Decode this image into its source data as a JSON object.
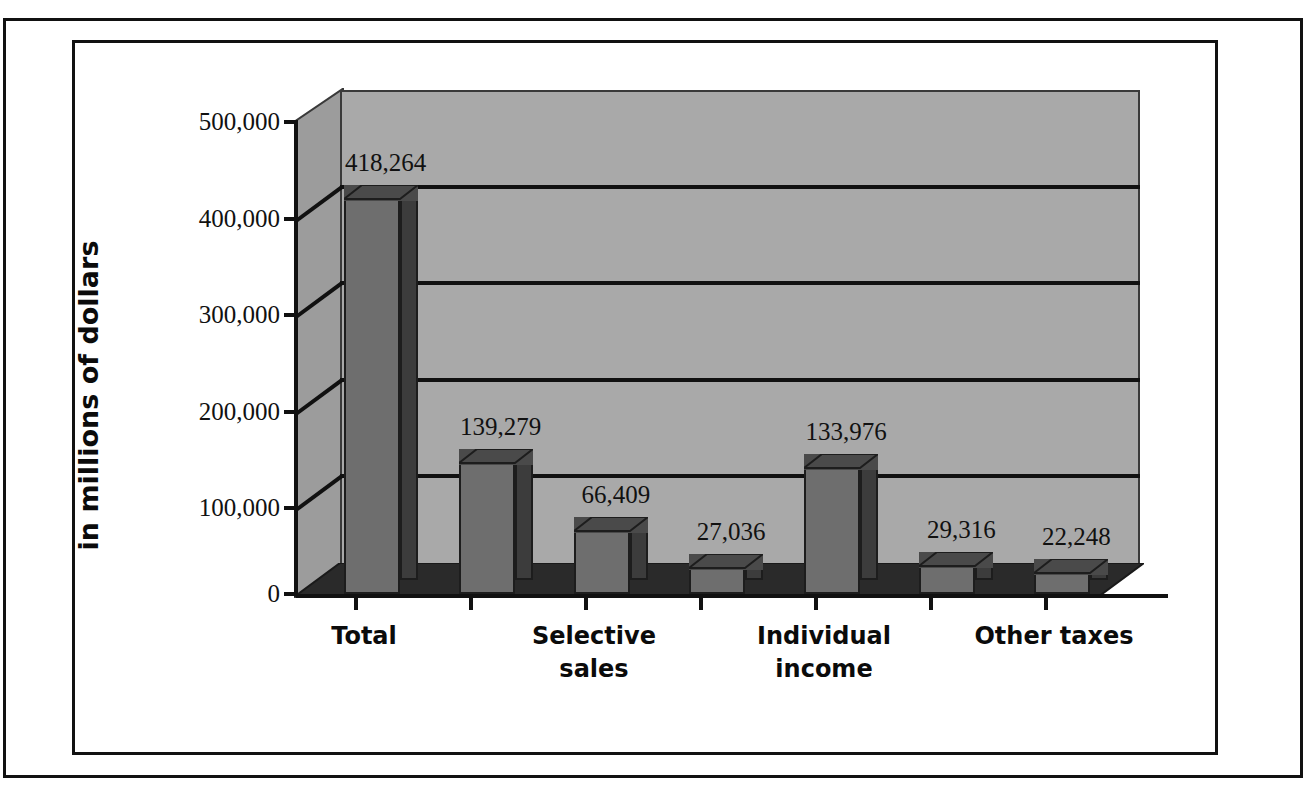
{
  "chart_data": {
    "type": "bar",
    "title": "",
    "subtitle": "",
    "xlabel": "",
    "ylabel": "in millions of dollars",
    "ylim": [
      0,
      500000
    ],
    "grid": true,
    "legend": null,
    "style": "3d-column",
    "categories": [
      "Total",
      "",
      "Selective sales",
      "",
      "Individual income",
      "",
      "Other taxes"
    ],
    "visible_tick_labels": [
      {
        "index": 0,
        "lines": [
          "Total"
        ]
      },
      {
        "index": 2,
        "lines": [
          "Selective",
          "sales"
        ]
      },
      {
        "index": 4,
        "lines": [
          "Individual",
          "income"
        ]
      },
      {
        "index": 6,
        "lines": [
          "Other taxes"
        ]
      }
    ],
    "values": [
      418264,
      139279,
      66409,
      27036,
      133976,
      29316,
      22248
    ],
    "value_labels": [
      "418,264",
      "139,279",
      "66,409",
      "27,036",
      "133,976",
      "29,316",
      "22,248"
    ],
    "ytick_values": [
      500000,
      400000,
      300000,
      200000,
      100000,
      0
    ],
    "ytick_labels": [
      "500,000",
      "400,000",
      "300,000",
      "200,000",
      "100,000",
      "0"
    ]
  },
  "colors": {
    "back_wall": "#a9a9a9",
    "left_wall": "#9c9c9c",
    "floor": "#2a2a2a",
    "bar_front": "#6e6e6e",
    "bar_side": "#3c3c3c",
    "bar_top": "#4a4a4a",
    "line": "#111111",
    "page_background": "#ffffff"
  }
}
